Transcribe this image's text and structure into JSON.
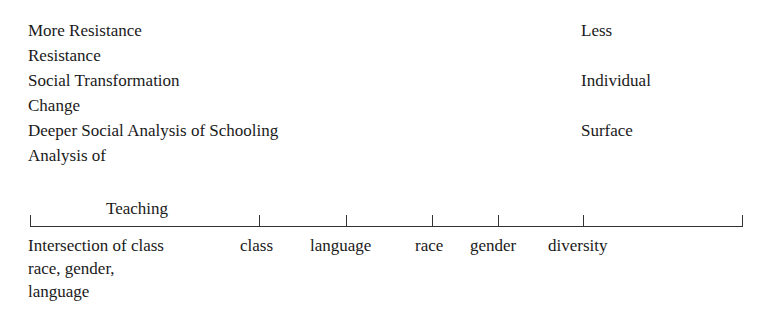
{
  "left_column": [
    "More Resistance",
    "Resistance",
    "Social Transformation",
    "Change",
    "Deeper Social Analysis of Schooling",
    "Analysis of"
  ],
  "right_column": [
    "Less",
    "Individual",
    "Surface"
  ],
  "scale": {
    "title": "Teaching",
    "labels": {
      "intersection": [
        "Intersection of class",
        "race, gender,",
        "language"
      ],
      "class": "class",
      "language": "language",
      "race": "race",
      "gender": "gender",
      "diversity": "diversity"
    }
  }
}
